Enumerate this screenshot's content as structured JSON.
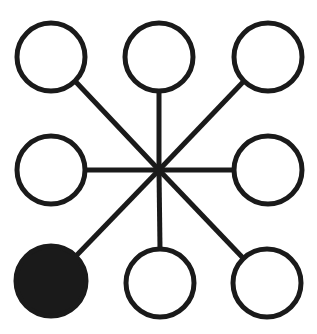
{
  "figure": {
    "type": "node-link-diagram",
    "width": 317,
    "height": 334,
    "background_color": "#ffffff",
    "stroke_color": "#1a1a1a",
    "fill_empty_color": "#ffffff",
    "fill_marked_color": "#1a1a1a",
    "node_stroke_width": 5,
    "spoke_stroke_width": 5,
    "node_radius": 34
  },
  "hub": {
    "label": "center-hub",
    "cx": 159,
    "cy": 170,
    "visible": false
  },
  "nodes": [
    {
      "id": "node-top-left",
      "label": "top-left",
      "cx": 51,
      "cy": 57,
      "r": 34,
      "state": "empty",
      "fill": "#ffffff",
      "stroke": "#1a1a1a"
    },
    {
      "id": "node-top-center",
      "label": "top-center",
      "cx": 159,
      "cy": 57,
      "r": 34,
      "state": "empty",
      "fill": "#ffffff",
      "stroke": "#1a1a1a"
    },
    {
      "id": "node-top-right",
      "label": "top-right",
      "cx": 268,
      "cy": 57,
      "r": 34,
      "state": "empty",
      "fill": "#ffffff",
      "stroke": "#1a1a1a"
    },
    {
      "id": "node-middle-left",
      "label": "middle-left",
      "cx": 51,
      "cy": 170,
      "r": 34,
      "state": "empty",
      "fill": "#ffffff",
      "stroke": "#1a1a1a"
    },
    {
      "id": "node-middle-right",
      "label": "middle-right",
      "cx": 268,
      "cy": 170,
      "r": 34,
      "state": "empty",
      "fill": "#ffffff",
      "stroke": "#1a1a1a"
    },
    {
      "id": "node-bottom-left",
      "label": "bottom-left",
      "cx": 51,
      "cy": 281,
      "r": 35,
      "state": "filled",
      "fill": "#1a1a1a",
      "stroke": "#1a1a1a"
    },
    {
      "id": "node-bottom-center",
      "label": "bottom-center",
      "cx": 160,
      "cy": 283,
      "r": 34,
      "state": "empty",
      "fill": "#ffffff",
      "stroke": "#1a1a1a"
    },
    {
      "id": "node-bottom-right",
      "label": "bottom-right",
      "cx": 267,
      "cy": 283,
      "r": 34,
      "state": "empty",
      "fill": "#ffffff",
      "stroke": "#1a1a1a"
    }
  ],
  "spokes": [
    {
      "id": "spoke-to-top-left",
      "label": "hub-to-top-left",
      "x1": 159,
      "y1": 170,
      "x2": 75,
      "y2": 81,
      "stroke": "#1a1a1a",
      "width": 5
    },
    {
      "id": "spoke-to-top-center",
      "label": "hub-to-top-center",
      "x1": 159,
      "y1": 170,
      "x2": 159,
      "y2": 91,
      "stroke": "#1a1a1a",
      "width": 5
    },
    {
      "id": "spoke-to-top-right",
      "label": "hub-to-top-right",
      "x1": 159,
      "y1": 170,
      "x2": 244,
      "y2": 81,
      "stroke": "#1a1a1a",
      "width": 5
    },
    {
      "id": "spoke-to-middle-left",
      "label": "hub-to-middle-left",
      "x1": 159,
      "y1": 170,
      "x2": 85,
      "y2": 170,
      "stroke": "#1a1a1a",
      "width": 5
    },
    {
      "id": "spoke-to-middle-right",
      "label": "hub-to-middle-right",
      "x1": 159,
      "y1": 170,
      "x2": 234,
      "y2": 170,
      "stroke": "#1a1a1a",
      "width": 5
    },
    {
      "id": "spoke-to-bottom-left",
      "label": "hub-to-bottom-left",
      "x1": 159,
      "y1": 170,
      "x2": 76,
      "y2": 256,
      "stroke": "#1a1a1a",
      "width": 5
    },
    {
      "id": "spoke-to-bottom-center",
      "label": "hub-to-bottom-center",
      "x1": 159,
      "y1": 170,
      "x2": 160,
      "y2": 249,
      "stroke": "#1a1a1a",
      "width": 5
    },
    {
      "id": "spoke-to-bottom-right",
      "label": "hub-to-bottom-right",
      "x1": 159,
      "y1": 170,
      "x2": 243,
      "y2": 258,
      "stroke": "#1a1a1a",
      "width": 5
    }
  ]
}
